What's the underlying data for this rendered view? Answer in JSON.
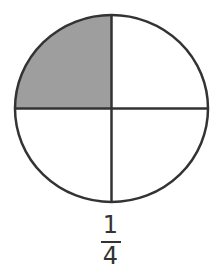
{
  "diagram": {
    "type": "fraction-circle",
    "total_parts": 4,
    "shaded_parts": 1,
    "shaded_quadrant": "top-left",
    "colors": {
      "stroke": "#333333",
      "shaded_fill": "#9e9e9e",
      "unshaded_fill": "#ffffff"
    }
  },
  "fraction": {
    "numerator": "1",
    "denominator": "4"
  }
}
